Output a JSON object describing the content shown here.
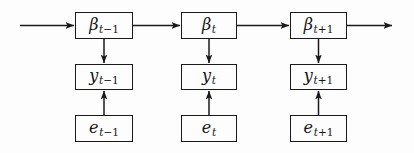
{
  "diagram": {
    "type": "flow-diagram",
    "canvas": {
      "width": 414,
      "height": 153,
      "background": "#fdfdfd"
    },
    "stroke_color": "#1a1a1a",
    "text_color": "#141414",
    "rows": [
      {
        "id": "beta",
        "name": "state-row",
        "symbol": "beta"
      },
      {
        "id": "y",
        "name": "observation-row",
        "symbol": "y"
      },
      {
        "id": "e",
        "name": "error-row",
        "symbol": "e"
      }
    ],
    "columns": [
      {
        "id": "prev",
        "subscript": "t-1"
      },
      {
        "id": "curr",
        "subscript": "t"
      },
      {
        "id": "next",
        "subscript": "t+1"
      }
    ],
    "nodes": [
      {
        "id": "beta-prev",
        "name": "beta-t-minus-1-node",
        "base": "β",
        "sub_var": "t",
        "sub_op": "−",
        "sub_num": "1",
        "x": 75,
        "y": 12,
        "w": 58,
        "h": 27
      },
      {
        "id": "beta-curr",
        "name": "beta-t-node",
        "base": "β",
        "sub_var": "t",
        "sub_op": "",
        "sub_num": "",
        "x": 181,
        "y": 12,
        "w": 56,
        "h": 27
      },
      {
        "id": "beta-next",
        "name": "beta-t-plus-1-node",
        "base": "β",
        "sub_var": "t",
        "sub_op": "+",
        "sub_num": "1",
        "x": 290,
        "y": 12,
        "w": 57,
        "h": 27
      },
      {
        "id": "y-prev",
        "name": "y-t-minus-1-node",
        "base": "y",
        "sub_var": "t",
        "sub_op": "−",
        "sub_num": "1",
        "x": 75,
        "y": 64,
        "w": 58,
        "h": 26
      },
      {
        "id": "y-curr",
        "name": "y-t-node",
        "base": "y",
        "sub_var": "t",
        "sub_op": "",
        "sub_num": "",
        "x": 181,
        "y": 64,
        "w": 56,
        "h": 26
      },
      {
        "id": "y-next",
        "name": "y-t-plus-1-node",
        "base": "y",
        "sub_var": "t",
        "sub_op": "+",
        "sub_num": "1",
        "x": 290,
        "y": 64,
        "w": 57,
        "h": 26
      },
      {
        "id": "e-prev",
        "name": "e-t-minus-1-node",
        "base": "e",
        "sub_var": "t",
        "sub_op": "−",
        "sub_num": "1",
        "x": 75,
        "y": 115,
        "w": 58,
        "h": 27
      },
      {
        "id": "e-curr",
        "name": "e-t-node",
        "base": "e",
        "sub_var": "t",
        "sub_op": "",
        "sub_num": "",
        "x": 181,
        "y": 115,
        "w": 56,
        "h": 27
      },
      {
        "id": "e-next",
        "name": "e-t-plus-1-node",
        "base": "e",
        "sub_var": "t",
        "sub_op": "+",
        "sub_num": "1",
        "x": 290,
        "y": 115,
        "w": 57,
        "h": 27
      }
    ],
    "edges": [
      {
        "id": "edge-in",
        "name": "incoming-arrow",
        "direction": "right",
        "from": "boundary-left",
        "to": "beta-prev"
      },
      {
        "id": "edge-b1-b2",
        "name": "beta-prev-to-beta-curr-arrow",
        "direction": "right",
        "from": "beta-prev",
        "to": "beta-curr"
      },
      {
        "id": "edge-b2-b3",
        "name": "beta-curr-to-beta-next-arrow",
        "direction": "right",
        "from": "beta-curr",
        "to": "beta-next"
      },
      {
        "id": "edge-out",
        "name": "outgoing-arrow",
        "direction": "right",
        "from": "beta-next",
        "to": "boundary-right"
      },
      {
        "id": "edge-b1-y1",
        "name": "beta-prev-to-y-prev-arrow",
        "direction": "down",
        "from": "beta-prev",
        "to": "y-prev"
      },
      {
        "id": "edge-b2-y2",
        "name": "beta-curr-to-y-curr-arrow",
        "direction": "down",
        "from": "beta-curr",
        "to": "y-curr"
      },
      {
        "id": "edge-b3-y3",
        "name": "beta-next-to-y-next-arrow",
        "direction": "down",
        "from": "beta-next",
        "to": "y-next"
      },
      {
        "id": "edge-e1-y1",
        "name": "e-prev-to-y-prev-arrow",
        "direction": "up",
        "from": "e-prev",
        "to": "y-prev"
      },
      {
        "id": "edge-e2-y2",
        "name": "e-curr-to-y-curr-arrow",
        "direction": "up",
        "from": "e-curr",
        "to": "y-curr"
      },
      {
        "id": "edge-e3-y3",
        "name": "e-next-to-y-next-arrow",
        "direction": "up",
        "from": "e-next",
        "to": "y-next"
      }
    ]
  }
}
